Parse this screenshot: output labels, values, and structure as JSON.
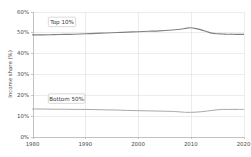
{
  "chart_data": {
    "type": "line",
    "title": "",
    "xlabel": "",
    "ylabel": "Income share (%)",
    "xlim": [
      1980,
      2020
    ],
    "ylim": [
      0,
      60
    ],
    "grid": true,
    "legend_position": "inline-labels",
    "x_ticks": [
      "1980",
      "1990",
      "2000",
      "2010",
      "2020"
    ],
    "x_tick_values": [
      1980,
      1990,
      2000,
      2010,
      2020
    ],
    "y_ticks": [
      "0%",
      "10%",
      "20%",
      "30%",
      "40%",
      "50%",
      "60%"
    ],
    "y_tick_values": [
      0,
      10,
      20,
      30,
      40,
      50,
      60
    ],
    "x": [
      1980,
      1982,
      1984,
      1986,
      1988,
      1990,
      1992,
      1994,
      1996,
      1998,
      2000,
      2002,
      2004,
      2006,
      2008,
      2009,
      2010,
      2011,
      2012,
      2013,
      2014,
      2015,
      2016,
      2017,
      2018,
      2019,
      2020
    ],
    "series": [
      {
        "name": "Top 10%",
        "color": "#808080",
        "width": 1.15,
        "label_x": 1983.0,
        "label_y": 55.0,
        "values": [
          48.8,
          48.8,
          48.9,
          49.0,
          49.1,
          49.3,
          49.5,
          49.7,
          49.9,
          50.1,
          50.3,
          50.5,
          50.7,
          51.0,
          51.5,
          51.9,
          52.2,
          51.8,
          51.2,
          50.4,
          49.6,
          49.3,
          49.2,
          49.1,
          49.1,
          49.0,
          49.0
        ]
      },
      {
        "name": "Bottom 50%",
        "color": "#a8a8a8",
        "width": 1.0,
        "label_x": 1983.0,
        "label_y": 18.2,
        "values": [
          13.2,
          13.2,
          13.1,
          13.1,
          13.0,
          13.0,
          12.9,
          12.8,
          12.7,
          12.5,
          12.4,
          12.3,
          12.2,
          12.1,
          11.8,
          11.6,
          11.6,
          11.7,
          11.9,
          12.2,
          12.5,
          12.8,
          13.0,
          13.0,
          13.0,
          13.0,
          13.0
        ]
      }
    ]
  }
}
